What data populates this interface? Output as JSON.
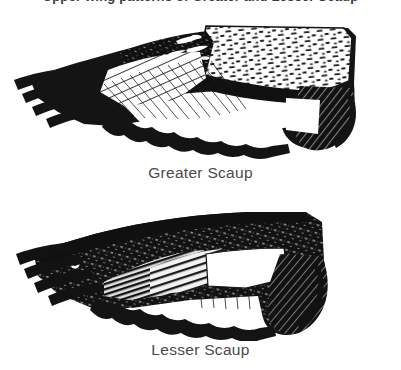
{
  "page": {
    "background_color": "#ffffff",
    "ink_color": "#141414",
    "caption_color": "#4a4a4a",
    "width": 401,
    "height": 370
  },
  "cropped_heading": {
    "text": "Upper wing patterns of Greater and Lesser Scaup",
    "note": "only descenders visible at top edge"
  },
  "figures": [
    {
      "id": "greater-scaup-wing",
      "caption": "Greater Scaup",
      "subject": "duck upper wing, spread, pen-and-ink",
      "orientation": "primaries to left, wing base to right",
      "speculum": {
        "color": "#ffffff",
        "texture": "stippled dashes",
        "extent": "white stripe extends well onto the primaries"
      },
      "primaries": {
        "color": "#141414",
        "shafts": "fine parallel lines"
      },
      "eye_spot": false
    },
    {
      "id": "lesser-scaup-wing",
      "caption": "Lesser Scaup",
      "subject": "duck upper wing, spread, pen-and-ink",
      "orientation": "primaries to left, wing base to right",
      "speculum": {
        "color": "#e8e8e8",
        "texture": "hatched / grey stripe",
        "extent": "white stripe confined to the secondaries, grey on primaries"
      },
      "primaries": {
        "color": "#141414",
        "shafts": "fine parallel lines"
      },
      "eye_spot": true
    }
  ],
  "captions": {
    "upper": "Greater Scaup",
    "lower": "Lesser Scaup"
  }
}
